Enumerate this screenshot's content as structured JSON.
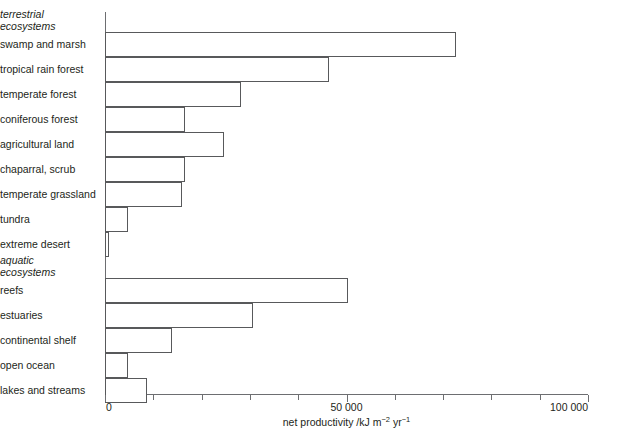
{
  "chart_data": {
    "type": "bar",
    "orientation": "horizontal",
    "title": "",
    "xlabel": "net productivity /kJ m−2 yr−1",
    "ylabel": "",
    "xlim": [
      0,
      100000
    ],
    "grid": false,
    "legend": null,
    "xticks": [
      0,
      10000,
      20000,
      30000,
      40000,
      50000,
      60000,
      70000,
      80000,
      90000,
      100000
    ],
    "xtick_labels": [
      {
        "value": 0,
        "text": "0"
      },
      {
        "value": 50000,
        "text": "50 000"
      },
      {
        "value": 100000,
        "text": "100 000"
      }
    ],
    "groups": [
      {
        "name": "terrestrial ecosystems",
        "line1": "terrestrial",
        "line2": "ecosystems"
      },
      {
        "name": "aquatic ecosystems",
        "line1": "aquatic",
        "line2": "ecosystems"
      }
    ],
    "categories": [
      "swamp and marsh",
      "tropical rain forest",
      "temperate forest",
      "coniferous forest",
      "agricultural land",
      "chaparral, scrub",
      "temperate grassland",
      "tundra",
      "extreme desert",
      "reefs",
      "estuaries",
      "continental shelf",
      "open ocean",
      "lakes and streams"
    ],
    "values": [
      72700,
      46400,
      28200,
      16600,
      24600,
      16600,
      15900,
      4800,
      800,
      50300,
      30600,
      13900,
      4800,
      8700
    ],
    "bars": [
      {
        "group": "terrestrial ecosystems",
        "label": "swamp and marsh",
        "value": 72700
      },
      {
        "group": "terrestrial ecosystems",
        "label": "tropical rain forest",
        "value": 46400
      },
      {
        "group": "terrestrial ecosystems",
        "label": "temperate forest",
        "value": 28200
      },
      {
        "group": "terrestrial ecosystems",
        "label": "coniferous forest",
        "value": 16600
      },
      {
        "group": "terrestrial ecosystems",
        "label": "agricultural land",
        "value": 24600
      },
      {
        "group": "terrestrial ecosystems",
        "label": "chaparral, scrub",
        "value": 16600
      },
      {
        "group": "terrestrial ecosystems",
        "label": "temperate grassland",
        "value": 15900
      },
      {
        "group": "terrestrial ecosystems",
        "label": "tundra",
        "value": 4800
      },
      {
        "group": "terrestrial ecosystems",
        "label": "extreme desert",
        "value": 800
      },
      {
        "group": "aquatic ecosystems",
        "label": "reefs",
        "value": 50300
      },
      {
        "group": "aquatic ecosystems",
        "label": "estuaries",
        "value": 30600
      },
      {
        "group": "aquatic ecosystems",
        "label": "continental shelf",
        "value": 13900
      },
      {
        "group": "aquatic ecosystems",
        "label": "open ocean",
        "value": 4800
      },
      {
        "group": "aquatic ecosystems",
        "label": "lakes and streams",
        "value": 8700
      }
    ],
    "colors": {
      "bar_fill": "#ffffff",
      "bar_stroke": "#58595b",
      "axis": "#6d6e71",
      "text": "#231f20",
      "background": "#ffffff"
    }
  },
  "labels": {
    "group_terrestrial_l1": "terrestrial",
    "group_terrestrial_l2": "ecosystems",
    "group_aquatic_l1": "aquatic",
    "group_aquatic_l2": "ecosystems",
    "cat_0": "swamp and marsh",
    "cat_1": "tropical rain forest",
    "cat_2": "temperate forest",
    "cat_3": "coniferous forest",
    "cat_4": "agricultural land",
    "cat_5": "chaparral, scrub",
    "cat_6": "temperate grassland",
    "cat_7": "tundra",
    "cat_8": "extreme desert",
    "cat_9": "reefs",
    "cat_10": "estuaries",
    "cat_11": "continental shelf",
    "cat_12": "open ocean",
    "cat_13": "lakes and streams"
  },
  "axis": {
    "tick_0": "0",
    "tick_50000": "50 000",
    "tick_100000": "100 000",
    "title_part1": "net productivity /kJ m",
    "title_sup1": "−2",
    "title_part2": " yr",
    "title_sup2": "−1"
  }
}
